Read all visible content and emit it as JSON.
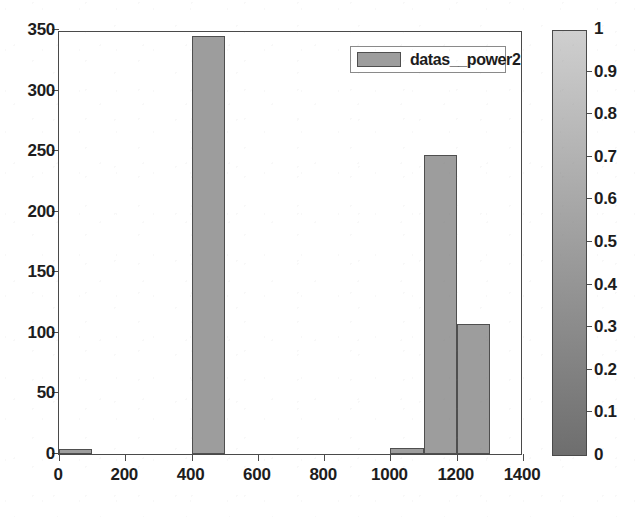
{
  "chart_data": {
    "type": "bar",
    "title": "",
    "subtitle": "",
    "xlabel": "",
    "ylabel": "",
    "xlim": [
      0,
      1400
    ],
    "ylim": [
      0,
      350
    ],
    "grid": false,
    "bin_width": 100,
    "legend": {
      "position": "top-right",
      "entries": [
        {
          "name": "datas__power2",
          "color": "#9d9d9d"
        }
      ]
    },
    "x_ticks": [
      {
        "value": 0,
        "label": "0"
      },
      {
        "value": 200,
        "label": "200"
      },
      {
        "value": 400,
        "label": "400"
      },
      {
        "value": 600,
        "label": "600"
      },
      {
        "value": 800,
        "label": "800"
      },
      {
        "value": 1000,
        "label": "1000"
      },
      {
        "value": 1200,
        "label": "1200"
      },
      {
        "value": 1400,
        "label": "1400"
      }
    ],
    "y_ticks": [
      {
        "value": 0,
        "label": "0"
      },
      {
        "value": 50,
        "label": "50"
      },
      {
        "value": 100,
        "label": "100"
      },
      {
        "value": 150,
        "label": "150"
      },
      {
        "value": 200,
        "label": "200"
      },
      {
        "value": 250,
        "label": "250"
      },
      {
        "value": 300,
        "label": "300"
      },
      {
        "value": 350,
        "label": "350"
      }
    ],
    "series": [
      {
        "name": "datas__power2",
        "color": "#9d9d9d",
        "edge_color": "#4f4f4f",
        "bins": [
          {
            "x0": 0,
            "x1": 100,
            "value": 4
          },
          {
            "x0": 400,
            "x1": 500,
            "value": 345
          },
          {
            "x0": 1000,
            "x1": 1100,
            "value": 5
          },
          {
            "x0": 1100,
            "x1": 1200,
            "value": 247
          },
          {
            "x0": 1200,
            "x1": 1300,
            "value": 107
          }
        ]
      }
    ],
    "colorbar": {
      "min": 0,
      "max": 1,
      "colormap": "gray",
      "low_color": "#6e6e6e",
      "high_color": "#cfcfcf",
      "ticks": [
        {
          "value": 0,
          "label": "0"
        },
        {
          "value": 0.1,
          "label": "0.1"
        },
        {
          "value": 0.2,
          "label": "0.2"
        },
        {
          "value": 0.3,
          "label": "0.3"
        },
        {
          "value": 0.4,
          "label": "0.4"
        },
        {
          "value": 0.5,
          "label": "0.5"
        },
        {
          "value": 0.6,
          "label": "0.6"
        },
        {
          "value": 0.7,
          "label": "0.7"
        },
        {
          "value": 0.8,
          "label": "0.8"
        },
        {
          "value": 0.9,
          "label": "0.9"
        },
        {
          "value": 1,
          "label": "1"
        }
      ]
    }
  }
}
